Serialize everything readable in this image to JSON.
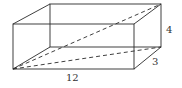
{
  "diagram": {
    "type": "rectangular-prism",
    "labels": {
      "length": "12",
      "depth": "3",
      "height": "4"
    },
    "colors": {
      "stroke": "#2a2a2a",
      "label": "#333333",
      "background": "#ffffff"
    }
  }
}
